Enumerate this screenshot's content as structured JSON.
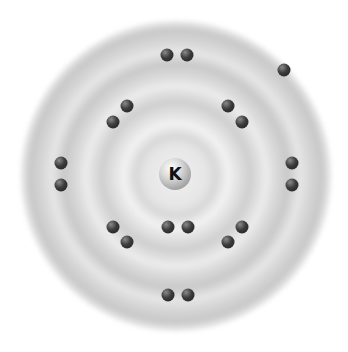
{
  "diagram": {
    "title": "",
    "type": "bohr-model",
    "element_symbol": "K",
    "electron_count": 19,
    "shells": [
      2,
      8,
      8,
      1
    ],
    "electrons": [
      {
        "x": 167,
        "y": 55
      },
      {
        "x": 187,
        "y": 55
      },
      {
        "x": 284,
        "y": 70
      },
      {
        "x": 127,
        "y": 106
      },
      {
        "x": 113,
        "y": 122
      },
      {
        "x": 228,
        "y": 106
      },
      {
        "x": 242,
        "y": 122
      },
      {
        "x": 61,
        "y": 163
      },
      {
        "x": 61,
        "y": 185
      },
      {
        "x": 292,
        "y": 163
      },
      {
        "x": 292,
        "y": 185
      },
      {
        "x": 113,
        "y": 227
      },
      {
        "x": 127,
        "y": 242
      },
      {
        "x": 168,
        "y": 227
      },
      {
        "x": 188,
        "y": 227
      },
      {
        "x": 242,
        "y": 227
      },
      {
        "x": 228,
        "y": 242
      },
      {
        "x": 168,
        "y": 295
      },
      {
        "x": 188,
        "y": 295
      }
    ]
  }
}
